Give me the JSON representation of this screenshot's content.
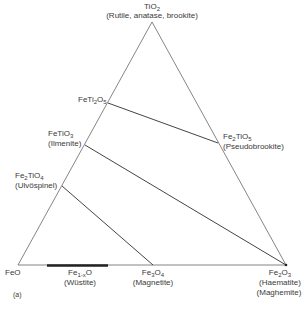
{
  "diagram": {
    "type": "ternary-phase-diagram",
    "panel_label": "(a)",
    "vertices": {
      "top": {
        "formula": "TiO2",
        "formula_parts": [
          "TiO",
          "2",
          ""
        ],
        "name": "(Rutile, anatase, brookite)"
      },
      "bottom_left": {
        "formula": "FeO",
        "formula_parts": [
          "FeO",
          "",
          ""
        ],
        "name": ""
      },
      "bottom_right": {
        "formula": "Fe2O3",
        "formula_parts": [
          "Fe",
          "2",
          "O",
          "3"
        ],
        "name": "(Haematite)",
        "name2": "(Maghemite)"
      }
    },
    "phases": [
      {
        "id": "feti2o5",
        "parts": [
          "FeTi",
          "2",
          "O",
          "5"
        ],
        "name": ""
      },
      {
        "id": "fetio3",
        "parts": [
          "FeTiO",
          "3"
        ],
        "name": "(Ilmenite)"
      },
      {
        "id": "fe2tio4",
        "parts": [
          "Fe",
          "2",
          "TiO",
          "4"
        ],
        "name": "(Ulvöspinel)"
      },
      {
        "id": "fe2tio5",
        "parts": [
          "Fe",
          "2",
          "TiO",
          "5"
        ],
        "name": "(Pseudobrookite)"
      },
      {
        "id": "wustite",
        "parts": [
          "Fe",
          "1-x",
          "O"
        ],
        "name": "(Wüstite)"
      },
      {
        "id": "fe3o4",
        "parts": [
          "Fe",
          "3",
          "O",
          "4"
        ],
        "name": "(Magnetite)"
      }
    ],
    "tie_lines": [
      {
        "from": "FeTi2O5",
        "to": "Fe2TiO5"
      },
      {
        "from": "FeTiO3",
        "to": "Fe2O3"
      },
      {
        "from": "Fe2TiO4",
        "to": "Fe3O4"
      }
    ],
    "solid_solution_bar": {
      "label": "Fe1-xO",
      "span": "Wüstite range along FeO–Fe2O3 edge"
    },
    "colors": {
      "line": "#555555",
      "text": "#3a3a3a",
      "bar": "#222222"
    }
  }
}
